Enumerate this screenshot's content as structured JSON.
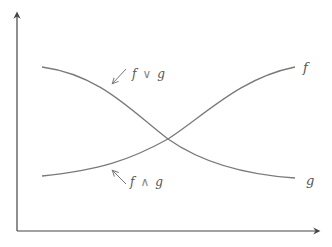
{
  "diagram": {
    "title": "",
    "colors": {
      "axis": "#444444",
      "curve": "#7a7a7a",
      "annotation": "#9a9a9a",
      "label": "#555555",
      "background": "#ffffff"
    },
    "axes": {
      "x_label": "",
      "y_label": "",
      "arrows": true
    },
    "curves": [
      {
        "name": "f",
        "label": "f",
        "shape": "increasing sigmoid"
      },
      {
        "name": "g",
        "label": "g",
        "shape": "decreasing sigmoid"
      }
    ],
    "annotations": [
      {
        "name": "join",
        "text_f": "f",
        "operator": "∨",
        "text_g": "g",
        "meaning": "max (upper envelope)"
      },
      {
        "name": "meet",
        "text_f": "f",
        "operator": "∧",
        "text_g": "g",
        "meaning": "min (lower envelope)"
      }
    ]
  }
}
